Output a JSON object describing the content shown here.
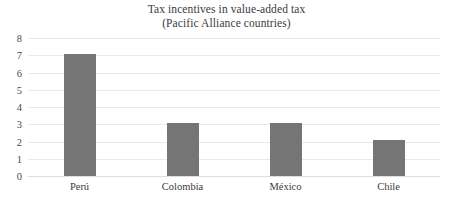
{
  "chart_data": {
    "type": "bar",
    "title": "Tax incentives in value-added tax",
    "subtitle": "(Pacific Alliance countries)",
    "title_lines": [
      "Tax incentives in value-added tax",
      "(Pacific Alliance countries)"
    ],
    "categories": [
      "Perú",
      "Colombia",
      "México",
      "Chile"
    ],
    "values": [
      7.1,
      3.1,
      3.1,
      2.1
    ],
    "xlabel": "",
    "ylabel": "",
    "ylim": [
      0,
      8
    ],
    "yticks": [
      0,
      1,
      2,
      3,
      4,
      5,
      6,
      7,
      8
    ],
    "ytick_labels": [
      "0",
      "1",
      "2",
      "3",
      "4",
      "5",
      "6",
      "7",
      "8"
    ],
    "grid": true,
    "grid_axis": "y",
    "legend": false,
    "legend_position": "none",
    "colors": {
      "bar": "#757575",
      "grid": "#e9e9e9",
      "baseline": "#dedede",
      "text": "#3b3b3b",
      "tick_text": "#4a4a4a",
      "background": "#ffffff"
    }
  }
}
